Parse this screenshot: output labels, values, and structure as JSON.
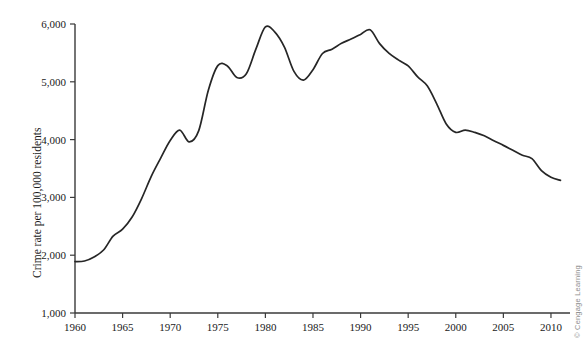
{
  "figure": {
    "ylabel": "Crime rate per 100,000 residents",
    "credit": "© Cengage Learning"
  },
  "chart_data": {
    "type": "line",
    "title": "",
    "xlabel": "",
    "ylabel": "Crime rate per 100,000 residents",
    "xlim": [
      1960,
      2012
    ],
    "ylim": [
      1000,
      6000
    ],
    "grid": false,
    "legend": null,
    "xticks": [
      1960,
      1965,
      1970,
      1975,
      1980,
      1985,
      1990,
      1995,
      2000,
      2005,
      2010
    ],
    "xtick_labels": [
      "1960",
      "1965",
      "1970",
      "1975",
      "1980",
      "1985",
      "1990",
      "1995",
      "2000",
      "2005",
      "2010"
    ],
    "yticks": [
      1000,
      2000,
      3000,
      4000,
      5000,
      6000
    ],
    "ytick_labels": [
      "1,000",
      "2,000",
      "3,000",
      "4,000",
      "5,000",
      "6,000"
    ],
    "line_color": "#262626",
    "x": [
      1960,
      1961,
      1962,
      1963,
      1964,
      1965,
      1966,
      1967,
      1968,
      1969,
      1970,
      1971,
      1972,
      1973,
      1974,
      1975,
      1976,
      1977,
      1978,
      1979,
      1980,
      1981,
      1982,
      1983,
      1984,
      1985,
      1986,
      1987,
      1988,
      1989,
      1990,
      1991,
      1992,
      1993,
      1994,
      1995,
      1996,
      1997,
      1998,
      1999,
      2000,
      2001,
      2002,
      2003,
      2004,
      2005,
      2006,
      2007,
      2008,
      2009,
      2010,
      2011
    ],
    "values": [
      1890,
      1900,
      1970,
      2090,
      2330,
      2450,
      2660,
      2980,
      3360,
      3680,
      3985,
      4165,
      3960,
      4155,
      4850,
      5280,
      5275,
      5075,
      5140,
      5565,
      5950,
      5860,
      5600,
      5180,
      5030,
      5210,
      5490,
      5565,
      5665,
      5740,
      5820,
      5900,
      5660,
      5490,
      5375,
      5275,
      5085,
      4930,
      4620,
      4270,
      4125,
      4165,
      4125,
      4065,
      3980,
      3900,
      3815,
      3730,
      3670,
      3465,
      3350,
      3295
    ],
    "series_name": "Crime rate"
  }
}
